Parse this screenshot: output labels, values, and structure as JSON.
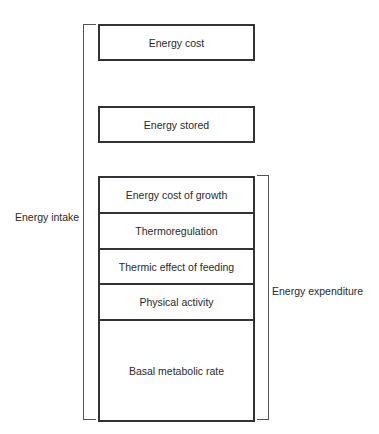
{
  "diagram": {
    "boxes": {
      "energy_cost": "Energy cost",
      "energy_stored": "Energy stored"
    },
    "expenditure_components": [
      "Energy cost of growth",
      "Thermoregulation",
      "Thermic effect of feeding",
      "Physical activity",
      "Basal metabolic rate"
    ],
    "brackets": {
      "left_label": "Energy intake",
      "right_label": "Energy expenditure"
    },
    "colors": {
      "line": "#333333",
      "text": "#2a2a2a",
      "background": "#ffffff"
    }
  }
}
